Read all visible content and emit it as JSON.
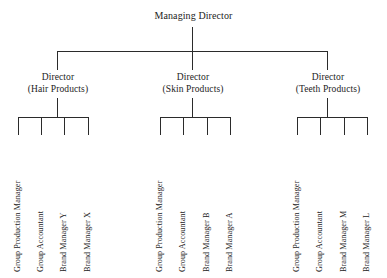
{
  "chart": {
    "root": {
      "label": "Managing Director"
    },
    "branches": [
      {
        "title": "Director",
        "subtitle": "(Hair Products)",
        "leaves": [
          "Group Production Manager",
          "Group Accountant",
          "Brand Manager Y",
          "Brand Manager X"
        ]
      },
      {
        "title": "Director",
        "subtitle": "(Skin Products)",
        "leaves": [
          "Group Production Manager",
          "Group Accountant",
          "Brand Manager B",
          "Brand Manager A"
        ]
      },
      {
        "title": "Director",
        "subtitle": "(Teeth Products)",
        "leaves": [
          "Group Production Manager",
          "Group Accountant",
          "Brand Manager M",
          "Brand Manager L"
        ]
      }
    ],
    "colors": {
      "background": "#ffffff",
      "line": "#2b2b2b",
      "text": "#1c1c1c"
    }
  }
}
